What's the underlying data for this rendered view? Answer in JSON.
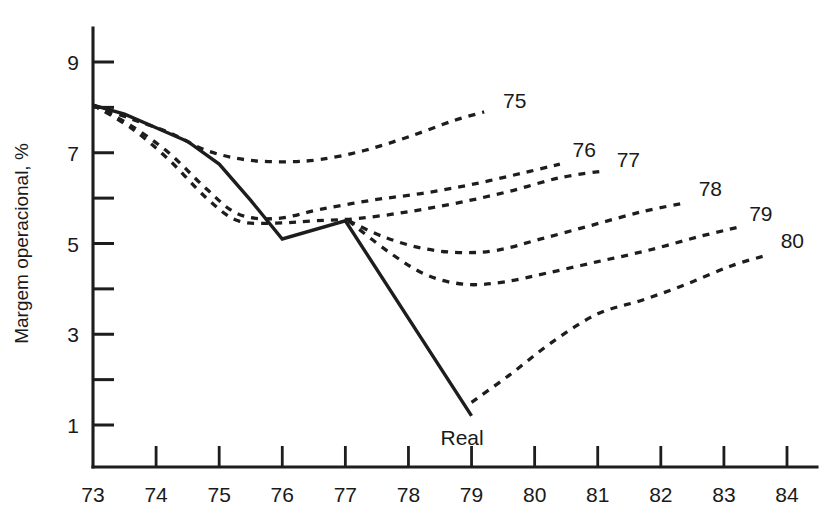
{
  "chart_data": {
    "type": "line",
    "title": "",
    "subtitle": "",
    "xlabel": "",
    "ylabel": "Margem operacional, %",
    "xlim": [
      73,
      84
    ],
    "ylim": [
      0,
      9.9
    ],
    "grid": false,
    "legend_position": "inline-end-labels",
    "x_tick_labels": [
      "73",
      "74",
      "75",
      "76",
      "77",
      "78",
      "79",
      "80",
      "81",
      "82",
      "83",
      "84"
    ],
    "x_ticks": [
      73,
      74,
      75,
      76,
      77,
      78,
      79,
      80,
      81,
      82,
      83,
      84
    ],
    "y_tick_labels": [
      "9",
      "7",
      "5",
      "3",
      "1"
    ],
    "y_ticks_major": [
      9,
      7,
      5,
      3,
      1
    ],
    "y_ticks_minor": [
      8,
      6,
      4,
      2
    ],
    "series": [
      {
        "name": "Real",
        "label": "Real",
        "style": "solid",
        "x": [
          73,
          73.5,
          74,
          74.5,
          75,
          75.5,
          76,
          77,
          79
        ],
        "values": [
          8.05,
          7.85,
          7.55,
          7.25,
          6.75,
          5.95,
          5.1,
          5.5,
          1.2
        ]
      },
      {
        "name": "75",
        "label": "75",
        "style": "dashed",
        "x": [
          73,
          73.6,
          74.2,
          74.8,
          75.4,
          76,
          76.6,
          77.3,
          78,
          78.7,
          79.2
        ],
        "values": [
          8.05,
          7.75,
          7.45,
          7.05,
          6.85,
          6.8,
          6.85,
          7.05,
          7.35,
          7.7,
          7.9
        ]
      },
      {
        "name": "76",
        "label": "76",
        "style": "dashed",
        "x": [
          73,
          73.6,
          74.2,
          74.8,
          75.3,
          75.9,
          76.6,
          77.4,
          78.2,
          79,
          79.8,
          80.4
        ],
        "values": [
          8.05,
          7.6,
          7.0,
          6.2,
          5.65,
          5.55,
          5.75,
          5.95,
          6.1,
          6.3,
          6.55,
          6.75
        ]
      },
      {
        "name": "77",
        "label": "77",
        "style": "dashed",
        "x": [
          73,
          73.6,
          74.2,
          74.8,
          75.3,
          75.9,
          76.5,
          77.2,
          78,
          78.8,
          79.6,
          80.4,
          81.1
        ],
        "values": [
          8.05,
          7.55,
          6.85,
          6.0,
          5.5,
          5.45,
          5.5,
          5.55,
          5.7,
          5.9,
          6.15,
          6.45,
          6.6
        ]
      },
      {
        "name": "78",
        "label": "78",
        "style": "dashed",
        "x": [
          77.05,
          77.6,
          78.2,
          78.8,
          79.4,
          80.1,
          80.9,
          81.7,
          82.4
        ],
        "values": [
          5.5,
          5.15,
          4.9,
          4.8,
          4.85,
          5.1,
          5.4,
          5.7,
          5.9
        ]
      },
      {
        "name": "79",
        "label": "79",
        "style": "dashed",
        "x": [
          77.05,
          77.7,
          78.3,
          78.9,
          79.5,
          80.2,
          81,
          81.8,
          82.6,
          83.2
        ],
        "values": [
          5.5,
          4.8,
          4.3,
          4.1,
          4.15,
          4.35,
          4.6,
          4.85,
          5.15,
          5.35
        ]
      },
      {
        "name": "80",
        "label": "80",
        "style": "dashed",
        "x": [
          79,
          79.6,
          80.3,
          81,
          81.7,
          82.4,
          83.1,
          83.7
        ],
        "values": [
          1.5,
          2.1,
          2.85,
          3.45,
          3.75,
          4.1,
          4.5,
          4.75
        ]
      }
    ],
    "series_end_labels": [
      {
        "name": "75",
        "text": "75",
        "x": 79.5,
        "y": 8.15
      },
      {
        "name": "76",
        "text": "76",
        "x": 80.6,
        "y": 7.05
      },
      {
        "name": "77",
        "text": "77",
        "x": 81.3,
        "y": 6.85
      },
      {
        "name": "78",
        "text": "78",
        "x": 82.6,
        "y": 6.2
      },
      {
        "name": "79",
        "text": "79",
        "x": 83.4,
        "y": 5.65
      },
      {
        "name": "80",
        "text": "80",
        "x": 83.9,
        "y": 5.05
      }
    ],
    "real_label": {
      "text": "Real",
      "x": 78.85,
      "y": 0.72
    },
    "colors": {
      "axis": "#1d1d1d",
      "line": "#1d1d1d",
      "background": "#ffffff",
      "text": "#1a1a1a"
    }
  }
}
